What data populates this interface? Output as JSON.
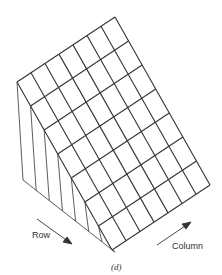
{
  "figure": {
    "caption": "(d)",
    "row_label": "Row",
    "column_label": "Column",
    "grid_rows": 7,
    "grid_columns": 7,
    "line_color": "#333333",
    "geometry": {
      "top_left": [
        17,
        82
      ],
      "top_back": [
        115,
        17
      ],
      "right": [
        208,
        183
      ],
      "front": [
        112,
        250
      ],
      "base_left": [
        23,
        180
      ],
      "base_front": [
        115,
        252
      ]
    }
  }
}
